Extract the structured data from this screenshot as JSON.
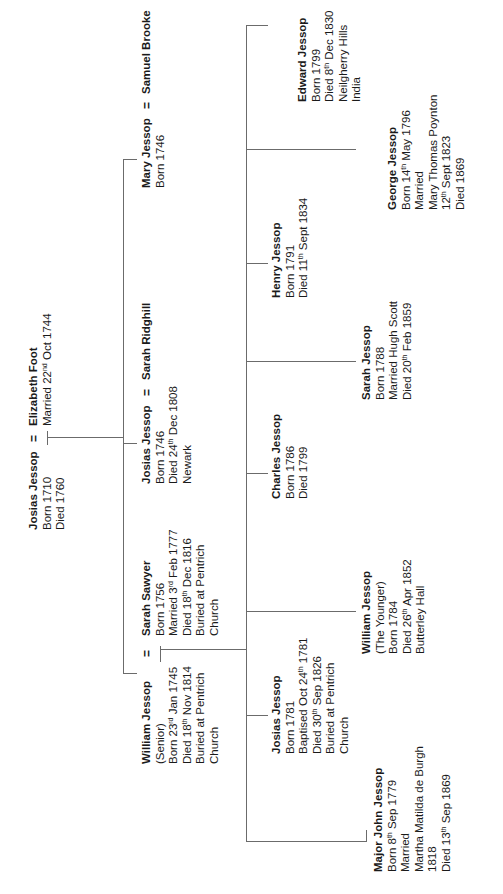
{
  "connector_color": "#6b6b6b",
  "text_color": "#1a1a1a",
  "marriage_symbol": "=",
  "generation1": {
    "husband": {
      "name": "Josias Jessop",
      "lines": [
        "Born 1710",
        "Died 1760"
      ]
    },
    "wife": {
      "name": "Elizabeth Foot",
      "lines": [
        "Married 22nd Oct 1744"
      ]
    }
  },
  "generation2": [
    {
      "name": "William Jessop",
      "lines": [
        "(Senior)",
        "Born 23rd Jan 1745",
        "Died 18th Nov 1814",
        "Buried at Pentrich",
        "Church"
      ],
      "spouse": {
        "name": "Sarah Sawyer",
        "lines": [
          "Born 1756",
          "Married 3rd Feb 1777",
          "Died 18th Dec 1816",
          "Buried at Pentrich",
          "Church"
        ]
      }
    },
    {
      "name": "Josias Jessop",
      "lines": [
        "Born 1746",
        "Died 24th Dec 1808",
        "Newark"
      ],
      "spouse": {
        "name": "Sarah Ridghill",
        "lines": []
      }
    },
    {
      "name": "Mary Jessop",
      "lines": [
        "Born 1746"
      ],
      "spouse": {
        "name": "Samuel Brooke",
        "lines": []
      }
    }
  ],
  "generation3": [
    {
      "name": "Major John Jessop",
      "lines": [
        "Born 8th Sep 1779",
        "Married",
        "Martha Matilda de Burgh",
        "1818",
        "Died 13th Sep 1869"
      ]
    },
    {
      "name": "Josias Jessop",
      "lines": [
        "Born 1781",
        "Baptised Oct 24th 1781",
        "Died 30th Sep 1826",
        "Buried at Pentrich",
        "Church"
      ]
    },
    {
      "name": "William Jessop",
      "lines": [
        "(The Younger)",
        "Born 1784",
        "Died 26th Apr 1852",
        "Butterley Hall"
      ]
    },
    {
      "name": "Charles Jessop",
      "lines": [
        "Born 1786",
        "Died 1799"
      ]
    },
    {
      "name": "Sarah Jessop",
      "lines": [
        "Born 1788",
        "Married Hugh Scott",
        "Died 20th Feb 1859"
      ]
    },
    {
      "name": "Henry Jessop",
      "lines": [
        "Born 1791",
        "Died 11th Sept 1834"
      ]
    },
    {
      "name": "George Jessop",
      "lines": [
        "Born 14th May 1796",
        "Married",
        "Mary Thomas Poynton",
        "12th Sept 1823",
        "Died 1869"
      ]
    },
    {
      "name": "Edward Jessop",
      "lines": [
        "Born 1799",
        "Died 8th Dec 1830",
        "Neilgherry Hills",
        "India"
      ]
    }
  ]
}
